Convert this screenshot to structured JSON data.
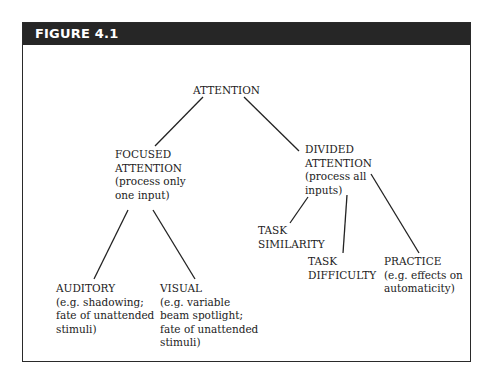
{
  "figure": {
    "label": "FIGURE 4.1",
    "header_color": "#262626",
    "border_color": "#2a2a2a"
  },
  "nodes": {
    "attention": {
      "title": [
        "ATTENTION"
      ],
      "desc": []
    },
    "focused": {
      "title": [
        "FOCUSED",
        "ATTENTION"
      ],
      "desc": [
        "(process only",
        "one input)"
      ]
    },
    "divided": {
      "title": [
        "DIVIDED",
        "ATTENTION"
      ],
      "desc": [
        "(process all",
        "inputs)"
      ]
    },
    "auditory": {
      "title": [
        "AUDITORY"
      ],
      "desc": [
        "(e.g. shadowing;",
        "fate of unattended",
        "stimuli)"
      ]
    },
    "visual": {
      "title": [
        "VISUAL"
      ],
      "desc": [
        "(e.g. variable",
        "beam spotlight;",
        "fate of unattended",
        "stimuli)"
      ]
    },
    "task_similarity": {
      "title": [
        "TASK",
        "SIMILARITY"
      ],
      "desc": []
    },
    "task_difficulty": {
      "title": [
        "TASK",
        "DIFFICULTY"
      ],
      "desc": []
    },
    "practice": {
      "title": [
        "PRACTICE"
      ],
      "desc": [
        "(e.g. effects on",
        "automaticity)"
      ]
    }
  },
  "edges": [
    {
      "from": "attention",
      "to": "focused"
    },
    {
      "from": "attention",
      "to": "divided"
    },
    {
      "from": "focused",
      "to": "auditory"
    },
    {
      "from": "focused",
      "to": "visual"
    },
    {
      "from": "divided",
      "to": "task_similarity"
    },
    {
      "from": "divided",
      "to": "task_difficulty"
    },
    {
      "from": "divided",
      "to": "practice"
    }
  ]
}
